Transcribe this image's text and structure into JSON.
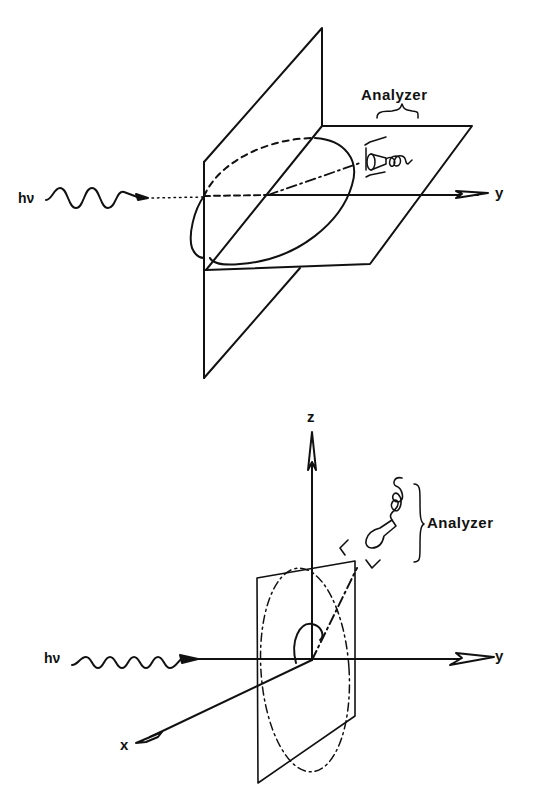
{
  "figure": {
    "panels": [
      {
        "id": "top",
        "labels": {
          "photon": "hν",
          "axis_y": "y",
          "analyzer": "Analyzer"
        },
        "elements": [
          "vertical-plane",
          "horizontal-plane",
          "polarization-ellipse",
          "photon-wave",
          "y-axis",
          "analyzer-detector",
          "emission-direction"
        ]
      },
      {
        "id": "bottom",
        "labels": {
          "photon": "hν",
          "axis_x": "x",
          "axis_y": "y",
          "axis_z": "z",
          "analyzer": "Analyzer"
        },
        "elements": [
          "x-axis",
          "y-axis",
          "z-axis",
          "transverse-plane",
          "polarization-circle",
          "photon-wave",
          "analyzer-detector",
          "emission-direction",
          "angle-arc"
        ]
      }
    ],
    "colors": {
      "ink": "#111111",
      "background": "#ffffff"
    }
  }
}
